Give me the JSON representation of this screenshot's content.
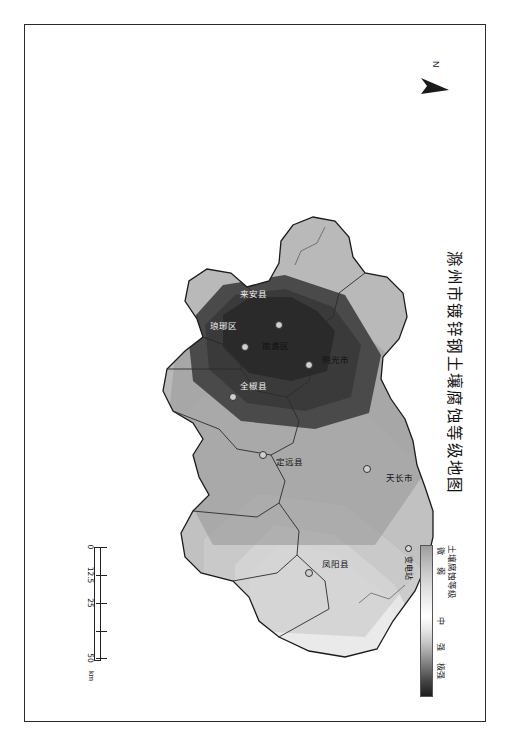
{
  "document": {
    "title": "滁州市镀锌钢土壤腐蚀等级地图",
    "orientation": "rotated-90"
  },
  "north_arrow": {
    "label": "N",
    "icon": "north-arrow-icon"
  },
  "legend": {
    "title": "土壤腐蚀等级",
    "labels": [
      "微",
      "弱",
      "中",
      "强",
      "极强"
    ],
    "station_label": "变电站",
    "station_icon": "circle-marker-icon",
    "ramp_stops": [
      "#9e9e9e",
      "#cfcfcf",
      "#ffffff",
      "#c8c8c8",
      "#6e6e6e",
      "#1c1c1c"
    ]
  },
  "scale_bar": {
    "ticks": [
      "0",
      "12.5",
      "25",
      "50"
    ],
    "unit": "km"
  },
  "map": {
    "counties": [
      {
        "name": "天长市",
        "x": 452,
        "y": 86,
        "tone": "light"
      },
      {
        "name": "明光市",
        "x": 334,
        "y": 150,
        "tone": "light"
      },
      {
        "name": "来安县",
        "x": 268,
        "y": 232,
        "tone": "dark"
      },
      {
        "name": "琅琊区",
        "x": 300,
        "y": 262,
        "tone": "dark"
      },
      {
        "name": "南谯区",
        "x": 320,
        "y": 210,
        "tone": "light"
      },
      {
        "name": "全椒县",
        "x": 360,
        "y": 232,
        "tone": "dark"
      },
      {
        "name": "定远县",
        "x": 436,
        "y": 196,
        "tone": "light"
      },
      {
        "name": "凤阳县",
        "x": 538,
        "y": 150,
        "tone": "light"
      }
    ],
    "stations": [
      {
        "x": 444,
        "y": 118
      },
      {
        "x": 340,
        "y": 176
      },
      {
        "x": 300,
        "y": 206
      },
      {
        "x": 322,
        "y": 240
      },
      {
        "x": 372,
        "y": 252
      },
      {
        "x": 430,
        "y": 222
      },
      {
        "x": 548,
        "y": 176
      }
    ]
  }
}
